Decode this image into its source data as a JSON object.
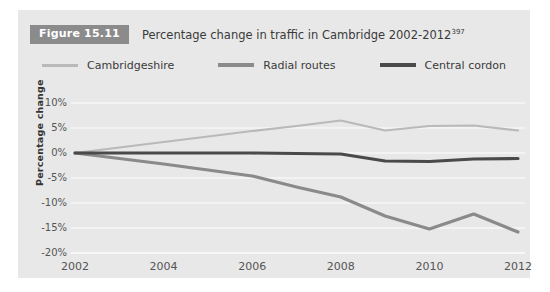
{
  "figure": {
    "badge_label": "Figure 15.11",
    "title_main": "Percentage change in traffic in Cambridge 2002-2012",
    "title_superscript": "397"
  },
  "legend": {
    "items": [
      {
        "label": "Cambridgeshire",
        "color": "#b9b9b9",
        "width": 2.2
      },
      {
        "label": "Radial routes",
        "color": "#8a8a8a",
        "width": 3.2
      },
      {
        "label": "Central cordon",
        "color": "#4a4a4a",
        "width": 3.2
      }
    ]
  },
  "axes": {
    "y_title": "Percentage change",
    "y_ticks": [
      "10%",
      "5%",
      "0%",
      "-5%",
      "-10%",
      "-15%",
      "-20%"
    ],
    "x_ticks": [
      "2002",
      "2004",
      "2006",
      "2008",
      "2010",
      "2012"
    ]
  },
  "colors": {
    "panel_background": "#e8e8e8",
    "badge_background": "#8b8b8b",
    "badge_text": "#ffffff",
    "gridline": "#f7f7f7",
    "axis_text": "#555555",
    "title_text": "#3a3a3a"
  },
  "chart_data": {
    "type": "line",
    "title": "Percentage change in traffic in Cambridge 2002-2012",
    "xlabel": "",
    "ylabel": "Percentage change",
    "x": [
      2002,
      2003,
      2004,
      2005,
      2006,
      2007,
      2008,
      2009,
      2010,
      2011,
      2012
    ],
    "xlim": [
      2002,
      2012
    ],
    "ylim": [
      -20,
      10
    ],
    "ytick_values": [
      10,
      5,
      0,
      -5,
      -10,
      -15,
      -20
    ],
    "xtick_values": [
      2002,
      2004,
      2006,
      2008,
      2010,
      2012
    ],
    "grid": true,
    "legend_position": "top",
    "series": [
      {
        "name": "Cambridgeshire",
        "color": "#b9b9b9",
        "values": [
          0,
          1.1,
          2.2,
          3.3,
          4.4,
          5.4,
          6.5,
          4.5,
          5.4,
          5.5,
          4.5
        ]
      },
      {
        "name": "Radial routes",
        "color": "#8a8a8a",
        "values": [
          0,
          -1.1,
          -2.2,
          -3.4,
          -4.6,
          -6.8,
          -8.8,
          -12.6,
          -15.2,
          -12.2,
          -15.8
        ]
      },
      {
        "name": "Central cordon",
        "color": "#4a4a4a",
        "values": [
          0,
          0,
          0,
          0,
          0,
          -0.1,
          -0.2,
          -1.6,
          -1.7,
          -1.2,
          -1.1
        ]
      }
    ]
  }
}
